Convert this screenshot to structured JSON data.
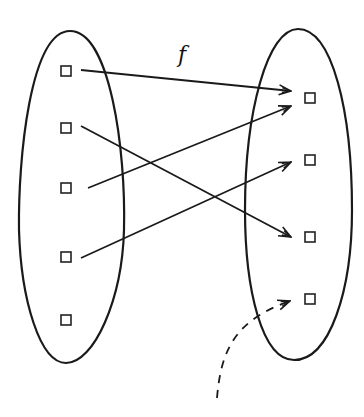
{
  "diagram": {
    "type": "function-mapping",
    "label": "f",
    "colors": {
      "stroke": "#1a1a1a",
      "background": "#ffffff"
    },
    "domain": {
      "name": "left-set",
      "points": [
        {
          "id": "a1",
          "x": 66,
          "y": 71
        },
        {
          "id": "a2",
          "x": 66,
          "y": 128
        },
        {
          "id": "a3",
          "x": 66,
          "y": 188
        },
        {
          "id": "a4",
          "x": 66,
          "y": 257
        },
        {
          "id": "a5",
          "x": 66,
          "y": 320
        }
      ]
    },
    "codomain": {
      "name": "right-set",
      "points": [
        {
          "id": "b1",
          "x": 310,
          "y": 98
        },
        {
          "id": "b2",
          "x": 310,
          "y": 160
        },
        {
          "id": "b3",
          "x": 310,
          "y": 237
        },
        {
          "id": "b4",
          "x": 310,
          "y": 299
        }
      ]
    },
    "mappings": [
      {
        "from": "a1",
        "to": "b1"
      },
      {
        "from": "a2",
        "to": "b3"
      },
      {
        "from": "a3",
        "to": "b1"
      },
      {
        "from": "a4",
        "to": "b2"
      }
    ],
    "unmapped_target_pointer": {
      "target": "b4",
      "style": "dashed"
    }
  }
}
